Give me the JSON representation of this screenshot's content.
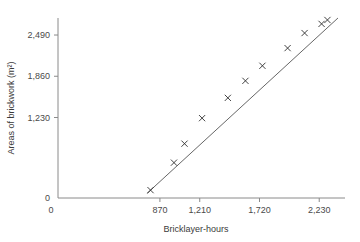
{
  "chart_data": {
    "type": "scatter",
    "title": "",
    "xlabel": "Bricklayer-hours",
    "ylabel": "Areas of brickwork (m²)",
    "xlim": [
      0,
      2450
    ],
    "ylim": [
      0,
      2750
    ],
    "grid": false,
    "legend": null,
    "x_ticks": [
      "0",
      "870",
      "1,210",
      "1,720",
      "2,230"
    ],
    "x_tick_values": [
      0,
      870,
      1210,
      1720,
      2230
    ],
    "y_ticks": [
      "0",
      "1,230",
      "1,860",
      "2,490"
    ],
    "y_tick_values": [
      0,
      1230,
      1860,
      2490
    ],
    "marker": "cross",
    "series": [
      {
        "name": "Brickwork observations",
        "points": [
          {
            "x": 790,
            "y": 120
          },
          {
            "x": 990,
            "y": 540
          },
          {
            "x": 1080,
            "y": 830
          },
          {
            "x": 1230,
            "y": 1220
          },
          {
            "x": 1450,
            "y": 1530
          },
          {
            "x": 1600,
            "y": 1790
          },
          {
            "x": 1745,
            "y": 2020
          },
          {
            "x": 1960,
            "y": 2290
          },
          {
            "x": 2105,
            "y": 2520
          },
          {
            "x": 2250,
            "y": 2660
          },
          {
            "x": 2300,
            "y": 2720
          }
        ]
      }
    ],
    "trend_line": {
      "name": "line of best fit",
      "x_start": 760,
      "y_start": 70,
      "x_end": 2390,
      "y_end": 2750
    }
  }
}
